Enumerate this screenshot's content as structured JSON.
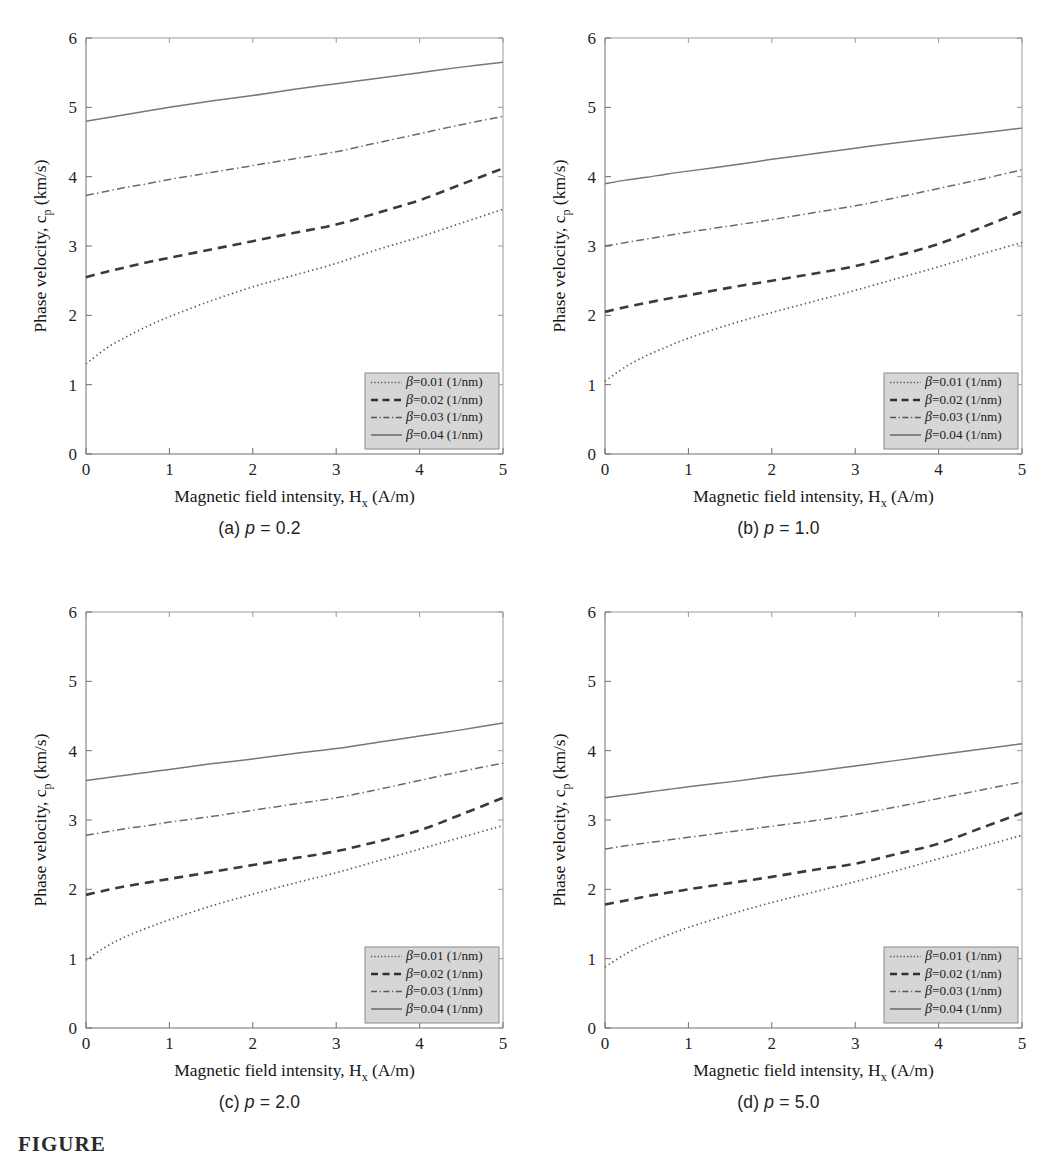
{
  "figure": {
    "footer_label": "FIGURE",
    "panel_count": 4
  },
  "axes": {
    "x_title_main": "Magnetic field intensity, H",
    "x_title_sub": "x",
    "x_title_tail": " (A/m)",
    "y_title_main": "Phase velocity, c",
    "y_title_sub": "p",
    "y_title_tail": " (km/s)",
    "x_ticks": [
      "0",
      "1",
      "2",
      "3",
      "4",
      "5"
    ],
    "y_ticks": [
      "0",
      "1",
      "2",
      "3",
      "4",
      "5",
      "6"
    ]
  },
  "legend": {
    "entries": [
      {
        "beta": "β",
        "text": "=0.01 (1/nm)",
        "style": "dotted"
      },
      {
        "beta": "β",
        "text": "=0.02 (1/nm)",
        "style": "dashed"
      },
      {
        "beta": "β",
        "text": "=0.03 (1/nm)",
        "style": "dash-dot"
      },
      {
        "beta": "β",
        "text": "=0.04 (1/nm)",
        "style": "solid"
      }
    ]
  },
  "panels": [
    {
      "id": "a",
      "caption_prefix": "(a) ",
      "caption_var": "p",
      "caption_value": " = 0.2"
    },
    {
      "id": "b",
      "caption_prefix": "(b) ",
      "caption_var": "p",
      "caption_value": " = 1.0"
    },
    {
      "id": "c",
      "caption_prefix": "(c) ",
      "caption_var": "p",
      "caption_value": " = 2.0"
    },
    {
      "id": "d",
      "caption_prefix": "(d) ",
      "caption_var": "p",
      "caption_value": " = 5.0"
    }
  ],
  "chart_data": [
    {
      "type": "line",
      "panel": "a",
      "title": "(a) p = 0.2",
      "xlabel": "Magnetic field intensity, H_x (A/m)",
      "ylabel": "Phase velocity, c_p (km/s)",
      "xlim": [
        0,
        5
      ],
      "ylim": [
        0,
        6
      ],
      "grid": false,
      "legend_position": "lower-right",
      "x": [
        0,
        0.25,
        0.5,
        0.75,
        1,
        1.5,
        2,
        2.5,
        3,
        3.5,
        4,
        4.5,
        5
      ],
      "series": [
        {
          "name": "β=0.01 (1/nm)",
          "style": "dotted",
          "values": [
            1.3,
            1.53,
            1.7,
            1.85,
            1.98,
            2.21,
            2.41,
            2.58,
            2.75,
            2.95,
            3.13,
            3.33,
            3.53
          ]
        },
        {
          "name": "β=0.02 (1/nm)",
          "style": "dashed",
          "values": [
            2.55,
            2.63,
            2.7,
            2.77,
            2.83,
            2.95,
            3.07,
            3.19,
            3.31,
            3.48,
            3.66,
            3.89,
            4.12
          ]
        },
        {
          "name": "β=0.03 (1/nm)",
          "style": "dash-dot",
          "values": [
            3.73,
            3.79,
            3.85,
            3.9,
            3.96,
            4.06,
            4.16,
            4.26,
            4.36,
            4.49,
            4.62,
            4.75,
            4.87
          ]
        },
        {
          "name": "β=0.04 (1/nm)",
          "style": "solid",
          "values": [
            4.8,
            4.85,
            4.9,
            4.95,
            5.0,
            5.09,
            5.17,
            5.26,
            5.34,
            5.42,
            5.5,
            5.58,
            5.65
          ]
        }
      ]
    },
    {
      "type": "line",
      "panel": "b",
      "title": "(b) p = 1.0",
      "xlabel": "Magnetic field intensity, H_x (A/m)",
      "ylabel": "Phase velocity, c_p (km/s)",
      "xlim": [
        0,
        5
      ],
      "ylim": [
        0,
        6
      ],
      "grid": false,
      "legend_position": "lower-right",
      "x": [
        0,
        0.25,
        0.5,
        0.75,
        1,
        1.5,
        2,
        2.5,
        3,
        3.5,
        4,
        4.5,
        5
      ],
      "series": [
        {
          "name": "β=0.01 (1/nm)",
          "style": "dotted",
          "values": [
            1.05,
            1.26,
            1.42,
            1.55,
            1.67,
            1.87,
            2.04,
            2.2,
            2.36,
            2.53,
            2.7,
            2.88,
            3.05
          ]
        },
        {
          "name": "β=0.02 (1/nm)",
          "style": "dashed",
          "values": [
            2.05,
            2.12,
            2.18,
            2.24,
            2.29,
            2.4,
            2.5,
            2.6,
            2.71,
            2.86,
            3.03,
            3.26,
            3.5
          ]
        },
        {
          "name": "β=0.03 (1/nm)",
          "style": "dash-dot",
          "values": [
            3.0,
            3.05,
            3.1,
            3.15,
            3.2,
            3.29,
            3.38,
            3.48,
            3.58,
            3.7,
            3.83,
            3.96,
            4.1
          ]
        },
        {
          "name": "β=0.04 (1/nm)",
          "style": "solid",
          "values": [
            3.9,
            3.95,
            3.99,
            4.04,
            4.08,
            4.16,
            4.25,
            4.33,
            4.41,
            4.49,
            4.56,
            4.63,
            4.7
          ]
        }
      ]
    },
    {
      "type": "line",
      "panel": "c",
      "title": "(c) p = 2.0",
      "xlabel": "Magnetic field intensity, H_x (A/m)",
      "ylabel": "Phase velocity, c_p (km/s)",
      "xlim": [
        0,
        5
      ],
      "ylim": [
        0,
        6
      ],
      "grid": false,
      "legend_position": "lower-right",
      "x": [
        0,
        0.25,
        0.5,
        0.75,
        1,
        1.5,
        2,
        2.5,
        3,
        3.5,
        4,
        4.5,
        5
      ],
      "series": [
        {
          "name": "β=0.01 (1/nm)",
          "style": "dotted",
          "values": [
            0.98,
            1.18,
            1.33,
            1.45,
            1.56,
            1.76,
            1.93,
            2.09,
            2.24,
            2.41,
            2.58,
            2.75,
            2.92
          ]
        },
        {
          "name": "β=0.02 (1/nm)",
          "style": "dashed",
          "values": [
            1.92,
            1.99,
            2.05,
            2.1,
            2.15,
            2.25,
            2.35,
            2.45,
            2.55,
            2.69,
            2.85,
            3.08,
            3.32
          ]
        },
        {
          "name": "β=0.03 (1/nm)",
          "style": "dash-dot",
          "values": [
            2.78,
            2.83,
            2.88,
            2.92,
            2.97,
            3.05,
            3.14,
            3.23,
            3.32,
            3.44,
            3.57,
            3.7,
            3.82
          ]
        },
        {
          "name": "β=0.04 (1/nm)",
          "style": "solid",
          "values": [
            3.57,
            3.61,
            3.65,
            3.69,
            3.73,
            3.81,
            3.88,
            3.96,
            4.03,
            4.12,
            4.21,
            4.3,
            4.4
          ]
        }
      ]
    },
    {
      "type": "line",
      "panel": "d",
      "title": "(d) p = 5.0",
      "xlabel": "Magnetic field intensity, H_x (A/m)",
      "ylabel": "Phase velocity, c_p (km/s)",
      "xlim": [
        0,
        5
      ],
      "ylim": [
        0,
        6
      ],
      "grid": false,
      "legend_position": "lower-right",
      "x": [
        0,
        0.25,
        0.5,
        0.75,
        1,
        1.5,
        2,
        2.5,
        3,
        3.5,
        4,
        4.5,
        5
      ],
      "series": [
        {
          "name": "β=0.01 (1/nm)",
          "style": "dotted",
          "values": [
            0.88,
            1.07,
            1.22,
            1.34,
            1.45,
            1.64,
            1.81,
            1.96,
            2.11,
            2.27,
            2.44,
            2.61,
            2.78
          ]
        },
        {
          "name": "β=0.02 (1/nm)",
          "style": "dashed",
          "values": [
            1.78,
            1.84,
            1.9,
            1.95,
            2.0,
            2.09,
            2.18,
            2.28,
            2.37,
            2.51,
            2.66,
            2.88,
            3.1
          ]
        },
        {
          "name": "β=0.03 (1/nm)",
          "style": "dash-dot",
          "values": [
            2.58,
            2.63,
            2.67,
            2.71,
            2.75,
            2.83,
            2.91,
            2.99,
            3.08,
            3.19,
            3.31,
            3.43,
            3.55
          ]
        },
        {
          "name": "β=0.04 (1/nm)",
          "style": "solid",
          "values": [
            3.32,
            3.36,
            3.4,
            3.44,
            3.48,
            3.55,
            3.63,
            3.7,
            3.78,
            3.86,
            3.94,
            4.02,
            4.1
          ]
        }
      ]
    }
  ]
}
